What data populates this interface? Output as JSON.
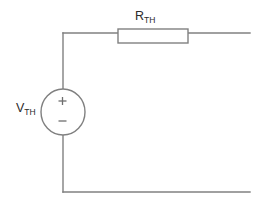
{
  "diagram": {
    "type": "schematic",
    "background_color": "#ffffff",
    "line_color": "#808080",
    "text_color": "#2b2b2b",
    "canvas": {
      "width": 269,
      "height": 203
    },
    "components": {
      "voltage_source": {
        "symbol": "circle-source",
        "label_main": "V",
        "label_subscript": "TH",
        "label_full": "VTH",
        "plus_sign": "+",
        "minus_sign": "−",
        "center_x": 63,
        "center_y": 112,
        "radius_x": 22,
        "radius_y": 23
      },
      "resistor": {
        "symbol": "rectangle-resistor",
        "label_main": "R",
        "label_subscript": "TH",
        "label_full": "RTH",
        "x": 118,
        "y": 29,
        "width": 70,
        "height": 14
      }
    },
    "wires": {
      "top_left_vertical": "M63,33 L63,90",
      "top_horizontal": "M63,33 L250,33",
      "bottom_left_vertical": "M63,135 L63,192",
      "bottom_horizontal": "M63,192 L250,192",
      "resistor_lead_left": "M108,36 L118,36",
      "resistor_lead_right": "M188,36 L197,36"
    },
    "terminals": {
      "top_right_x": 250,
      "bottom_right_x": 250
    }
  }
}
